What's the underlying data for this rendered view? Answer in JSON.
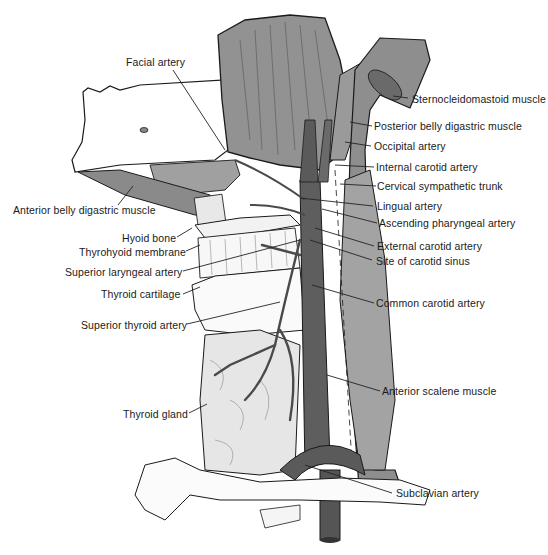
{
  "diagram": {
    "type": "anatomical illustration",
    "colors": {
      "muscle": "#8f8f8f",
      "muscle_dark": "#6f6f6f",
      "artery": "#5a5a5a",
      "bone": "#f2f2f2",
      "gland": "#e6e6e6",
      "outline": "#1a1a1a",
      "leader": "#222222"
    },
    "labels_left": [
      {
        "id": "facial-artery",
        "text": "Facial artery"
      },
      {
        "id": "anterior-belly-digastric",
        "text": "Anterior belly digastric muscle"
      },
      {
        "id": "hyoid-bone",
        "text": "Hyoid bone"
      },
      {
        "id": "thyrohyoid-membrane",
        "text": "Thyrohyoid membrane"
      },
      {
        "id": "superior-laryngeal-artery",
        "text": "Superior laryngeal artery"
      },
      {
        "id": "thyroid-cartilage",
        "text": "Thyroid cartilage"
      },
      {
        "id": "superior-thyroid-artery",
        "text": "Superior thyroid artery"
      },
      {
        "id": "thyroid-gland",
        "text": "Thyroid gland"
      }
    ],
    "labels_right": [
      {
        "id": "sternocleidomastoid",
        "text": "Sternocleidomastoid muscle"
      },
      {
        "id": "posterior-belly-digastric",
        "text": "Posterior belly digastric muscle"
      },
      {
        "id": "occipital-artery",
        "text": "Occipital artery"
      },
      {
        "id": "internal-carotid",
        "text": "Internal carotid artery"
      },
      {
        "id": "cervical-sympathetic-trunk",
        "text": "Cervical sympathetic trunk"
      },
      {
        "id": "lingual-artery",
        "text": "Lingual artery"
      },
      {
        "id": "ascending-pharyngeal",
        "text": "Ascending pharyngeal artery"
      },
      {
        "id": "external-carotid",
        "text": "External carotid artery"
      },
      {
        "id": "carotid-sinus",
        "text": "Site of carotid sinus"
      },
      {
        "id": "common-carotid",
        "text": "Common carotid artery"
      },
      {
        "id": "anterior-scalene",
        "text": "Anterior scalene muscle"
      },
      {
        "id": "subclavian-artery",
        "text": "Subclavian artery"
      }
    ]
  }
}
